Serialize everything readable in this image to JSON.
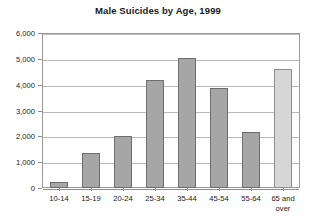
{
  "chart_data": {
    "type": "bar",
    "title": "Male Suicides by Age, 1999",
    "xlabel": "",
    "ylabel": "",
    "categories": [
      "10-14",
      "15-19",
      "20-24",
      "25-34",
      "35-44",
      "45-54",
      "55-64",
      "65 and over"
    ],
    "values": [
      250,
      1350,
      2000,
      4200,
      5050,
      3880,
      2180,
      4600
    ],
    "ylim": [
      0,
      6000
    ],
    "ytick_labels": [
      "6,000",
      "5,000",
      "4,000",
      "3,000",
      "2,000",
      "1,000",
      "0"
    ],
    "ytick_values": [
      6000,
      5000,
      4000,
      3000,
      2000,
      1000,
      0
    ],
    "grid": true,
    "legend": "none",
    "colors": {
      "bar_fill": "#a6a6a6",
      "bar_fill_last": "#d6d6d6",
      "bar_border": "#6e6e6e",
      "gridline": "#b9b9b9",
      "frame": "#9a9a9a",
      "text": "#1a1a1a",
      "background": "#ffffff"
    }
  }
}
